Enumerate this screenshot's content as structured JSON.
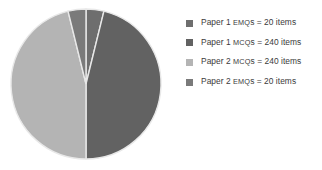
{
  "chart_data": {
    "type": "pie",
    "title": "",
    "categories": [
      "Paper 1 EMQs",
      "Paper 1 MCQs",
      "Paper 2 MCQs",
      "Paper 2 EMQs"
    ],
    "values": [
      20,
      240,
      240,
      20
    ],
    "units": "items",
    "total": 520,
    "start_angle_deg": 0,
    "direction": "clockwise",
    "legend_position": "right",
    "grid": false,
    "slices": [
      {
        "label": "Paper 1 EMQs",
        "value": 20,
        "value_text": "20 items",
        "color": "#6e6e6e",
        "angle_deg": 13.85,
        "percent": 3.85
      },
      {
        "label": "Paper 1 MCQs",
        "value": 240,
        "value_text": "240 items",
        "color": "#626262",
        "angle_deg": 166.15,
        "percent": 46.15
      },
      {
        "label": "Paper 2 MCQs",
        "value": 240,
        "value_text": "240 items",
        "color": "#b4b4b4",
        "angle_deg": 166.15,
        "percent": 46.15
      },
      {
        "label": "Paper 2 EMQs",
        "value": 20,
        "value_text": "20 items",
        "color": "#7a7a7a",
        "angle_deg": 13.85,
        "percent": 3.85
      }
    ]
  },
  "legend": {
    "items": [
      {
        "swatch_name": "legend-swatch-paper-1-emqs",
        "color": "#6e6e6e",
        "prefix": "Paper 1 ",
        "acronym": "EMQ",
        "suffix": "s = 20 items",
        "full_text": "Paper 1 EMQs = 20 items"
      },
      {
        "swatch_name": "legend-swatch-paper-1-mcqs",
        "color": "#626262",
        "prefix": "Paper 1 ",
        "acronym": "MCQ",
        "suffix": "s = 240 items",
        "full_text": "Paper 1 MCQs = 240 items"
      },
      {
        "swatch_name": "legend-swatch-paper-2-mcqs",
        "color": "#b4b4b4",
        "prefix": "Paper 2 ",
        "acronym": "MCQ",
        "suffix": "s = 240 items",
        "full_text": "Paper 2 MCQs = 240 items"
      },
      {
        "swatch_name": "legend-swatch-paper-2-emqs",
        "color": "#7a7a7a",
        "prefix": "Paper 2 ",
        "acronym": "EMQ",
        "suffix": "s = 20 items",
        "full_text": "Paper 2 EMQs = 20 items"
      }
    ]
  },
  "style": {
    "background": "#ffffff",
    "slice_border": "#e8e8e8",
    "text_color": "#3b3b3b"
  }
}
